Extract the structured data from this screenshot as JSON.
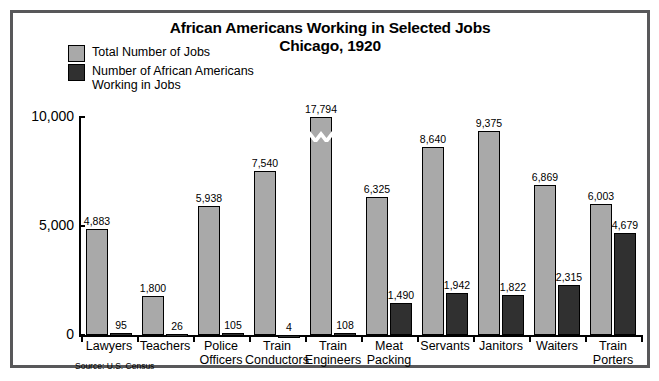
{
  "chart_data": {
    "type": "bar",
    "title": "African Americans Working in Selected Jobs",
    "subtitle": "Chicago, 1920",
    "xlabel": "",
    "ylabel": "",
    "ylim": [
      0,
      10000
    ],
    "yticks": [
      0,
      5000,
      10000
    ],
    "ytick_labels": [
      "0",
      "5,000",
      "10,000"
    ],
    "grid": false,
    "legend_position": "top-left",
    "axis_break_note": "Train Engineers total bar (17,794) is drawn with a zig-zag break because it exceeds the 10,000 axis maximum",
    "categories": [
      "Lawyers",
      "Teachers",
      "Police Officers",
      "Train Conductors",
      "Train Engineers",
      "Meat Packing",
      "Servants",
      "Janitors",
      "Waiters",
      "Train Porters"
    ],
    "category_lines": [
      [
        "Lawyers"
      ],
      [
        "Teachers"
      ],
      [
        "Police",
        "Officers"
      ],
      [
        "Train",
        "Conductors"
      ],
      [
        "Train",
        "Engineers"
      ],
      [
        "Meat",
        "Packing"
      ],
      [
        "Servants"
      ],
      [
        "Janitors"
      ],
      [
        "Waiters"
      ],
      [
        "Train",
        "Porters"
      ]
    ],
    "series": [
      {
        "name": "Total Number of Jobs",
        "color": "#a9a9a9",
        "values": [
          4883,
          1800,
          5938,
          7540,
          17794,
          6325,
          8640,
          9375,
          6869,
          6003
        ],
        "value_labels": [
          "4,883",
          "1,800",
          "5,938",
          "7,540",
          "17,794",
          "6,325",
          "8,640",
          "9,375",
          "6,869",
          "6,003"
        ]
      },
      {
        "name": "Number of African Americans Working in Jobs",
        "color": "#303030",
        "values": [
          95,
          26,
          105,
          4,
          108,
          1490,
          1942,
          1822,
          2315,
          4679
        ],
        "value_labels": [
          "95",
          "26",
          "105",
          "4",
          "108",
          "1,490",
          "1,942",
          "1,822",
          "2,315",
          "4,679"
        ]
      }
    ],
    "source": "Source: U.S. Census"
  },
  "legend": {
    "items": [
      {
        "label": "Total Number of Jobs",
        "swatch": "total"
      },
      {
        "label": "Number of African Americans Working in Jobs",
        "swatch": "aa"
      }
    ]
  },
  "colors": {
    "total_bar": "#a9a9a9",
    "african_american_bar": "#303030",
    "frame": "#58585a",
    "axis": "#000000",
    "background": "#ffffff"
  }
}
